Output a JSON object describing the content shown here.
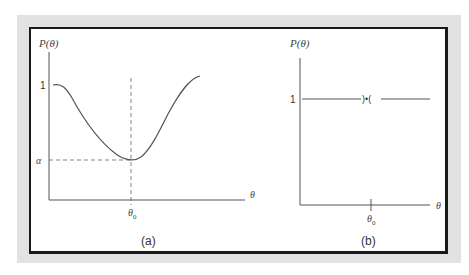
{
  "figure": {
    "panel_a": {
      "caption": "(a)",
      "y_axis_label": "P(θ)",
      "x_axis_label": "θ",
      "y_tick_one": "1",
      "y_tick_alpha": "α",
      "x_tick_theta0": "θ",
      "x_tick_theta0_sub": "0",
      "description": "Power function of a test with minimum α at θ0, approaching 1 away from θ0"
    },
    "panel_b": {
      "caption": "(b)",
      "y_axis_label": "P(θ)",
      "x_axis_label": "θ",
      "y_tick_one": "1",
      "x_tick_theta0": "θ",
      "x_tick_theta0_sub": "0",
      "marker": ")•(",
      "description": "Ideal power function equal to 1 everywhere except at θ0"
    }
  },
  "colors": {
    "frame": "#e2e2e2",
    "border": "#1a1a1a",
    "line": "#555555",
    "text": "#333333"
  }
}
